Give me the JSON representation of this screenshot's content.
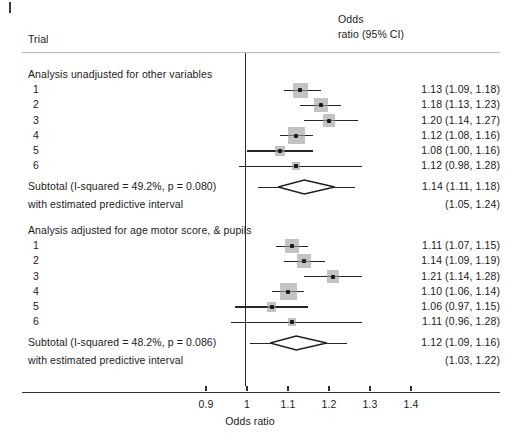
{
  "figure": {
    "type": "forest-plot",
    "column_header_left": "Trial",
    "column_header_right_line1": "Odds",
    "column_header_right_line2": "ratio (95% CI)",
    "axis_title": "Odds ratio",
    "null_value": 1
  },
  "chart_data": {
    "type": "forest",
    "title": "",
    "xlabel": "Odds ratio",
    "ylabel": "Trial",
    "xticks": [
      0.9,
      1,
      1.1,
      1.2,
      1.3,
      1.4
    ],
    "xtick_labels": [
      "0.9",
      "1",
      "1.1",
      "1.2",
      "1.3",
      "1.4"
    ],
    "xlim": [
      0.855,
      1.52
    ],
    "reference_line": 1,
    "grid": false,
    "legend": "none",
    "effect_measure": "Odds ratio (95% CI)",
    "groups": [
      {
        "label": "Analysis unadjusted for other variables",
        "rows": [
          {
            "label": "1",
            "est": 1.13,
            "lo": 1.09,
            "hi": 1.18,
            "weight": 0.82,
            "text": "1.13 (1.09, 1.18)"
          },
          {
            "label": "2",
            "est": 1.18,
            "lo": 1.13,
            "hi": 1.23,
            "weight": 0.74,
            "text": "1.18 (1.13, 1.23)"
          },
          {
            "label": "3",
            "est": 1.2,
            "lo": 1.14,
            "hi": 1.27,
            "weight": 0.6,
            "text": "1.20 (1.14, 1.27)"
          },
          {
            "label": "4",
            "est": 1.12,
            "lo": 1.08,
            "hi": 1.16,
            "weight": 1.0,
            "text": "1.12 (1.08, 1.16)"
          },
          {
            "label": "5",
            "est": 1.08,
            "lo": 1.0,
            "hi": 1.16,
            "weight": 0.34,
            "text": "1.08 (1.00, 1.16)"
          },
          {
            "label": "6",
            "est": 1.12,
            "lo": 0.98,
            "hi": 1.28,
            "weight": 0.18,
            "text": "1.12 (0.98, 1.28)"
          }
        ],
        "subtotal": {
          "label": "Subtotal (I-squared = 49.2%, p = 0.080)",
          "est": 1.14,
          "lo": 1.11,
          "hi": 1.18,
          "text": "1.14 (1.11, 1.18)",
          "i_squared": "49.2%",
          "p_value": "0.080",
          "predictive_label": "with estimated predictive interval",
          "predictive_lo": 1.05,
          "predictive_hi": 1.24,
          "predictive_text": "(1.05, 1.24)"
        }
      },
      {
        "label": "Analysis adjusted for age motor score, & pupils",
        "rows": [
          {
            "label": "1",
            "est": 1.11,
            "lo": 1.07,
            "hi": 1.15,
            "weight": 0.78,
            "text": "1.11 (1.07, 1.15)"
          },
          {
            "label": "2",
            "est": 1.14,
            "lo": 1.09,
            "hi": 1.19,
            "weight": 0.74,
            "text": "1.14 (1.09, 1.19)"
          },
          {
            "label": "3",
            "est": 1.21,
            "lo": 1.14,
            "hi": 1.28,
            "weight": 0.6,
            "text": "1.21 (1.14, 1.28)"
          },
          {
            "label": "4",
            "est": 1.1,
            "lo": 1.06,
            "hi": 1.14,
            "weight": 1.0,
            "text": "1.10 (1.06, 1.14)"
          },
          {
            "label": "5",
            "est": 1.06,
            "lo": 0.97,
            "hi": 1.15,
            "weight": 0.34,
            "text": "1.06 (0.97, 1.15)"
          },
          {
            "label": "6",
            "est": 1.11,
            "lo": 0.96,
            "hi": 1.28,
            "weight": 0.18,
            "text": "1.11 (0.96, 1.28)"
          }
        ],
        "subtotal": {
          "label": "Subtotal (I-squared = 48.2%, p = 0.086)",
          "est": 1.12,
          "lo": 1.09,
          "hi": 1.16,
          "text": "1.12 (1.09, 1.16)",
          "i_squared": "48.2%",
          "p_value": "0.086",
          "predictive_label": "with estimated predictive interval",
          "predictive_lo": 1.03,
          "predictive_hi": 1.22,
          "predictive_text": "(1.03, 1.22)"
        }
      }
    ]
  },
  "colors": {
    "line": "#262626",
    "weight_box": "#9e9e9e",
    "rule": "#b9b9b9",
    "text": "#1b1b1b",
    "background": "#ffffff"
  }
}
